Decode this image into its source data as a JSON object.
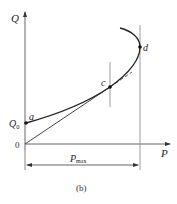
{
  "figure": {
    "caption": "(b)",
    "axes": {
      "y_label": "Q",
      "x_label": "P",
      "origin_label": "0"
    },
    "points": [
      {
        "id": "a",
        "label": "a",
        "note": "curve start on Q axis"
      },
      {
        "id": "c",
        "label": "c",
        "note": "tangent point of line from origin"
      },
      {
        "id": "d",
        "label": "d",
        "note": "rightmost point of curve"
      }
    ],
    "q0_label": "Q",
    "q0_subscript": "0",
    "pmax_label": "P",
    "pmax_subscript": "max",
    "colors": {
      "curve": "#222222",
      "axis": "#555555",
      "guide": "#9a9a9a"
    }
  }
}
